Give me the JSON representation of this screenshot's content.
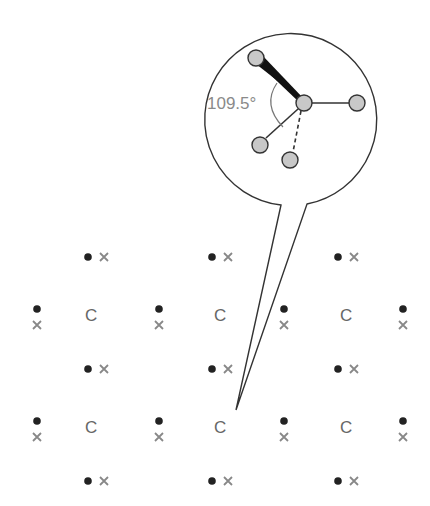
{
  "diagram": {
    "colors": {
      "line": "#333333",
      "atom_fill": "#c8c8c8",
      "dot": "#222222",
      "cross": "#888888",
      "label": "#666666",
      "angle_label": "#8a8a8a"
    },
    "callout": {
      "angle_label": "109.5°",
      "description": "Magnified tetrahedral carbon atom with four bonds"
    },
    "lattice": {
      "atom_symbol": "C",
      "atoms": [
        {
          "label": "C",
          "x": 91,
          "y": 315
        },
        {
          "label": "C",
          "x": 220,
          "y": 315
        },
        {
          "label": "C",
          "x": 346,
          "y": 315
        },
        {
          "label": "C",
          "x": 91,
          "y": 427
        },
        {
          "label": "C",
          "x": 220,
          "y": 427
        },
        {
          "label": "C",
          "x": 346,
          "y": 427
        }
      ],
      "electron_legend": {
        "dot": "electron from one atom",
        "cross": "electron from neighbouring atom"
      }
    }
  }
}
